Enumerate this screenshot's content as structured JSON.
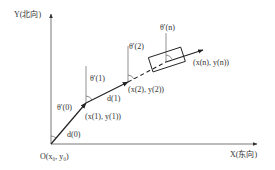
{
  "axes": {
    "y_label": "Y(北向)",
    "x_label": "X(东向)",
    "origin_label": "O(x₀, y₀)"
  },
  "angles": {
    "theta0": "θ′(0)",
    "theta1": "θ′(1)",
    "theta2": "θ′(2)",
    "thetan": "θ′(n)"
  },
  "distances": {
    "d0": "d(0)",
    "d1": "d(1)"
  },
  "points": {
    "p1": "(x(1), y(1))",
    "p2": "(x(2), y(2))",
    "pn": "(x(n), y(n))"
  },
  "colors": {
    "line": "#222222",
    "axis": "#555555",
    "text": "#333333"
  }
}
